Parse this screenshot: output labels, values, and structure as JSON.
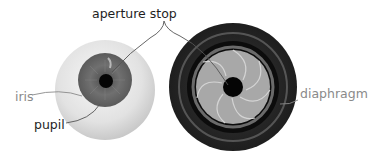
{
  "diagram": {
    "labels": {
      "aperture_stop": "aperture stop",
      "iris": "iris",
      "pupil": "pupil",
      "diaphragm": "diaphragm"
    },
    "colors": {
      "background": "#ffffff",
      "dark_label": "#1e1e1e",
      "light_label": "#8a8a8a",
      "sclera": "#e6e6e6",
      "iris": "#6a6a6a",
      "pupil": "#050505",
      "lens_body": "#2a2a2a",
      "lens_ring": "#5a5a5a",
      "aperture_blades": "#a8a8a8",
      "leader_line": "#555555"
    },
    "figures": [
      {
        "name": "human-eye",
        "parts": [
          "sclera",
          "iris",
          "pupil"
        ]
      },
      {
        "name": "camera-lens",
        "parts": [
          "lens-body",
          "diaphragm",
          "aperture"
        ]
      }
    ]
  }
}
